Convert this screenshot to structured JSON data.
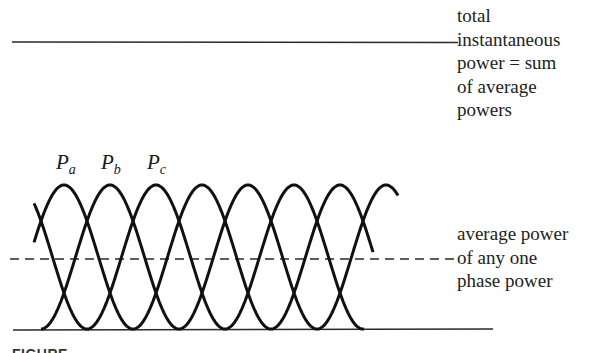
{
  "diagram": {
    "type": "three-phase-power-waveforms",
    "total_power_label": [
      "total",
      "instantaneous",
      "power = sum",
      "of average",
      "powers"
    ],
    "average_power_label": [
      "average power",
      "of any one",
      "phase power"
    ],
    "phase_labels": [
      {
        "main": "P",
        "sub": "a"
      },
      {
        "main": "P",
        "sub": "b"
      },
      {
        "main": "P",
        "sub": "c"
      }
    ],
    "caption_fragment": "FIGURE",
    "colors": {
      "ink": "#1a1a1a",
      "background": "#ffffff"
    }
  }
}
